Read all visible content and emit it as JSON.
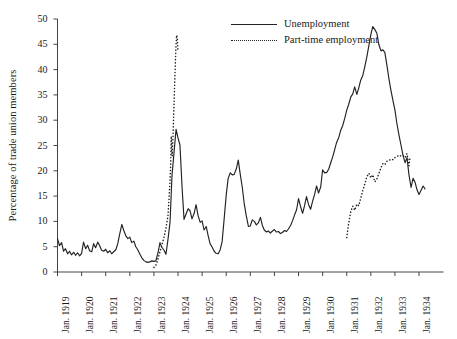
{
  "chart_data": {
    "type": "line",
    "title": "",
    "xlabel": "",
    "ylabel": "Percentage of trade union members",
    "ylim": [
      0,
      50
    ],
    "yticks": [
      0,
      5,
      10,
      15,
      20,
      25,
      30,
      35,
      40,
      45,
      50
    ],
    "xticks": [
      "Jan. 1919",
      "Jan. 1920",
      "Jan. 1921",
      "Jan. 1922",
      "Jan. 1923",
      "Jan. 1924",
      "Jan. 1925",
      "Jan. 1926",
      "Jan. 1927",
      "Jan. 1928",
      "Jan. 1929",
      "Jan. 1930",
      "Jan. 1931",
      "Jan. 1932",
      "Jan. 1933",
      "Jan. 1934"
    ],
    "xlim": [
      1919.0,
      1934.6
    ],
    "grid": false,
    "legend_position": "top-center-right",
    "series": [
      {
        "name": "Unemployment",
        "style": "solid",
        "color": "#222222",
        "points": [
          [
            1919.0,
            6.6
          ],
          [
            1919.08,
            5.2
          ],
          [
            1919.17,
            5.8
          ],
          [
            1919.25,
            4.1
          ],
          [
            1919.33,
            4.6
          ],
          [
            1919.42,
            3.6
          ],
          [
            1919.5,
            4.1
          ],
          [
            1919.58,
            3.4
          ],
          [
            1919.67,
            3.9
          ],
          [
            1919.75,
            3.3
          ],
          [
            1919.83,
            3.8
          ],
          [
            1919.92,
            3.2
          ],
          [
            1920.0,
            3.7
          ],
          [
            1920.08,
            5.9
          ],
          [
            1920.17,
            4.6
          ],
          [
            1920.25,
            5.3
          ],
          [
            1920.33,
            4.2
          ],
          [
            1920.42,
            4.0
          ],
          [
            1920.5,
            5.6
          ],
          [
            1920.58,
            4.8
          ],
          [
            1920.67,
            5.9
          ],
          [
            1920.75,
            5.2
          ],
          [
            1920.83,
            4.3
          ],
          [
            1920.92,
            4.1
          ],
          [
            1921.0,
            4.5
          ],
          [
            1921.08,
            3.8
          ],
          [
            1921.17,
            4.2
          ],
          [
            1921.25,
            3.6
          ],
          [
            1921.33,
            4.0
          ],
          [
            1921.42,
            4.4
          ],
          [
            1921.5,
            5.6
          ],
          [
            1921.58,
            7.5
          ],
          [
            1921.67,
            9.4
          ],
          [
            1921.75,
            8.2
          ],
          [
            1921.83,
            7.2
          ],
          [
            1921.92,
            6.6
          ],
          [
            1922.0,
            6.9
          ],
          [
            1922.08,
            5.8
          ],
          [
            1922.17,
            6.1
          ],
          [
            1922.25,
            5.0
          ],
          [
            1922.33,
            4.4
          ],
          [
            1922.42,
            3.5
          ],
          [
            1922.5,
            2.8
          ],
          [
            1922.58,
            2.3
          ],
          [
            1922.67,
            2.0
          ],
          [
            1922.75,
            1.9
          ],
          [
            1922.83,
            2.0
          ],
          [
            1922.92,
            2.2
          ],
          [
            1923.0,
            2.1
          ],
          [
            1923.08,
            2.2
          ],
          [
            1923.17,
            3.8
          ],
          [
            1923.25,
            5.8
          ],
          [
            1923.33,
            4.9
          ],
          [
            1923.42,
            4.3
          ],
          [
            1923.5,
            3.5
          ],
          [
            1923.58,
            6.3
          ],
          [
            1923.67,
            9.9
          ],
          [
            1923.75,
            19.1
          ],
          [
            1923.83,
            23.4
          ],
          [
            1923.92,
            28.2
          ],
          [
            1924.0,
            26.5
          ],
          [
            1924.08,
            25.1
          ],
          [
            1924.17,
            16.6
          ],
          [
            1924.25,
            10.4
          ],
          [
            1924.33,
            11.4
          ],
          [
            1924.42,
            12.5
          ],
          [
            1924.5,
            12.1
          ],
          [
            1924.58,
            10.5
          ],
          [
            1924.67,
            11.6
          ],
          [
            1924.75,
            13.3
          ],
          [
            1924.83,
            11.2
          ],
          [
            1924.92,
            9.8
          ],
          [
            1925.0,
            10.1
          ],
          [
            1925.08,
            8.3
          ],
          [
            1925.17,
            9.0
          ],
          [
            1925.25,
            7.2
          ],
          [
            1925.33,
            5.6
          ],
          [
            1925.42,
            4.9
          ],
          [
            1925.5,
            4.1
          ],
          [
            1925.58,
            3.7
          ],
          [
            1925.67,
            3.6
          ],
          [
            1925.75,
            4.4
          ],
          [
            1925.83,
            6.0
          ],
          [
            1925.92,
            10.8
          ],
          [
            1926.0,
            15.2
          ],
          [
            1926.08,
            18.5
          ],
          [
            1926.17,
            19.6
          ],
          [
            1926.25,
            19.2
          ],
          [
            1926.33,
            19.3
          ],
          [
            1926.42,
            20.4
          ],
          [
            1926.5,
            22.1
          ],
          [
            1926.58,
            19.4
          ],
          [
            1926.67,
            16.6
          ],
          [
            1926.75,
            13.4
          ],
          [
            1926.83,
            11.2
          ],
          [
            1926.92,
            9.0
          ],
          [
            1927.0,
            9.1
          ],
          [
            1927.08,
            10.3
          ],
          [
            1927.17,
            10.0
          ],
          [
            1927.25,
            9.3
          ],
          [
            1927.33,
            9.7
          ],
          [
            1927.42,
            10.8
          ],
          [
            1927.5,
            9.2
          ],
          [
            1927.58,
            8.3
          ],
          [
            1927.67,
            7.9
          ],
          [
            1927.75,
            8.1
          ],
          [
            1927.83,
            7.7
          ],
          [
            1927.92,
            8.1
          ],
          [
            1928.0,
            8.4
          ],
          [
            1928.08,
            7.9
          ],
          [
            1928.17,
            8.0
          ],
          [
            1928.25,
            7.6
          ],
          [
            1928.33,
            7.8
          ],
          [
            1928.42,
            8.2
          ],
          [
            1928.5,
            8.0
          ],
          [
            1928.58,
            8.5
          ],
          [
            1928.67,
            9.2
          ],
          [
            1928.75,
            10.1
          ],
          [
            1928.83,
            11.2
          ],
          [
            1928.92,
            12.3
          ],
          [
            1929.0,
            14.5
          ],
          [
            1929.08,
            13.0
          ],
          [
            1929.17,
            11.6
          ],
          [
            1929.25,
            13.1
          ],
          [
            1929.33,
            14.9
          ],
          [
            1929.42,
            13.3
          ],
          [
            1929.5,
            12.4
          ],
          [
            1929.58,
            13.9
          ],
          [
            1929.67,
            15.4
          ],
          [
            1929.75,
            17.0
          ],
          [
            1929.83,
            15.6
          ],
          [
            1929.92,
            16.8
          ],
          [
            1930.0,
            20.2
          ],
          [
            1930.08,
            19.6
          ],
          [
            1930.17,
            19.7
          ],
          [
            1930.25,
            20.3
          ],
          [
            1930.33,
            21.5
          ],
          [
            1930.42,
            22.8
          ],
          [
            1930.5,
            24.2
          ],
          [
            1930.58,
            25.6
          ],
          [
            1930.67,
            26.6
          ],
          [
            1930.75,
            28.0
          ],
          [
            1930.83,
            28.9
          ],
          [
            1930.92,
            30.4
          ],
          [
            1931.0,
            32.0
          ],
          [
            1931.08,
            33.1
          ],
          [
            1931.17,
            34.6
          ],
          [
            1931.25,
            35.2
          ],
          [
            1931.33,
            36.6
          ],
          [
            1931.42,
            35.1
          ],
          [
            1931.5,
            36.4
          ],
          [
            1931.58,
            37.9
          ],
          [
            1931.67,
            38.9
          ],
          [
            1931.75,
            40.6
          ],
          [
            1931.83,
            42.4
          ],
          [
            1931.92,
            44.8
          ],
          [
            1932.0,
            46.9
          ],
          [
            1932.08,
            48.5
          ],
          [
            1932.17,
            47.9
          ],
          [
            1932.25,
            47.2
          ],
          [
            1932.33,
            45.0
          ],
          [
            1932.42,
            43.7
          ],
          [
            1932.5,
            43.9
          ],
          [
            1932.58,
            43.4
          ],
          [
            1932.67,
            40.8
          ],
          [
            1932.75,
            38.2
          ],
          [
            1932.83,
            36.0
          ],
          [
            1932.92,
            33.8
          ],
          [
            1933.0,
            32.0
          ],
          [
            1933.08,
            29.4
          ],
          [
            1933.17,
            27.0
          ],
          [
            1933.25,
            25.1
          ],
          [
            1933.33,
            23.2
          ],
          [
            1933.42,
            21.6
          ],
          [
            1933.5,
            22.6
          ],
          [
            1933.58,
            19.3
          ],
          [
            1933.67,
            16.7
          ],
          [
            1933.75,
            18.5
          ],
          [
            1933.83,
            17.8
          ],
          [
            1933.92,
            16.2
          ],
          [
            1934.0,
            15.3
          ],
          [
            1934.08,
            16.1
          ],
          [
            1934.17,
            17.0
          ],
          [
            1934.25,
            16.4
          ]
        ]
      },
      {
        "name": "Part-time employment",
        "style": "dotted",
        "color": "#222222",
        "segments": [
          {
            "points": [
              [
                1923.0,
                0.9
              ],
              [
                1923.08,
                1.3
              ],
              [
                1923.17,
                2.6
              ],
              [
                1923.25,
                4.0
              ],
              [
                1923.33,
                5.3
              ],
              [
                1923.42,
                6.9
              ],
              [
                1923.5,
                8.7
              ],
              [
                1923.58,
                11.0
              ],
              [
                1923.62,
                14.0
              ],
              [
                1923.67,
                18.2
              ],
              [
                1923.7,
                22.0
              ],
              [
                1923.72,
                26.8
              ],
              [
                1923.74,
                24.0
              ],
              [
                1923.76,
                22.9
              ],
              [
                1923.79,
                26.5
              ],
              [
                1923.82,
                31.0
              ],
              [
                1923.85,
                35.5
              ],
              [
                1923.88,
                40.0
              ],
              [
                1923.91,
                44.0
              ],
              [
                1923.94,
                46.8
              ],
              [
                1923.97,
                46.4
              ],
              [
                1924.0,
                43.5
              ]
            ]
          },
          {
            "points": [
              [
                1931.0,
                6.8
              ],
              [
                1931.08,
                9.6
              ],
              [
                1931.17,
                12.0
              ],
              [
                1931.25,
                13.0
              ],
              [
                1931.33,
                12.2
              ],
              [
                1931.42,
                13.4
              ],
              [
                1931.5,
                13.1
              ],
              [
                1931.58,
                14.6
              ],
              [
                1931.67,
                16.2
              ],
              [
                1931.75,
                17.4
              ],
              [
                1931.83,
                18.8
              ],
              [
                1931.92,
                19.5
              ],
              [
                1932.0,
                18.6
              ],
              [
                1932.08,
                19.2
              ],
              [
                1932.17,
                17.8
              ],
              [
                1932.25,
                18.4
              ],
              [
                1932.33,
                19.4
              ],
              [
                1932.42,
                20.6
              ],
              [
                1932.5,
                21.4
              ],
              [
                1932.58,
                21.2
              ],
              [
                1932.67,
                21.9
              ],
              [
                1932.75,
                22.0
              ],
              [
                1932.83,
                22.3
              ],
              [
                1932.92,
                22.2
              ],
              [
                1933.0,
                22.6
              ],
              [
                1933.08,
                22.8
              ],
              [
                1933.17,
                23.1
              ],
              [
                1933.25,
                22.9
              ],
              [
                1933.33,
                23.0
              ],
              [
                1933.42,
                22.6
              ],
              [
                1933.5,
                23.4
              ],
              [
                1933.58,
                21.0
              ],
              [
                1933.62,
                22.4
              ]
            ]
          }
        ]
      }
    ]
  }
}
